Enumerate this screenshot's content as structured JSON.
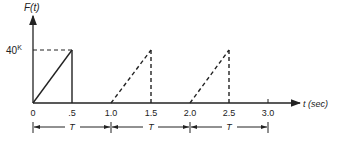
{
  "diagram": {
    "y_axis_label": "F(t)",
    "x_axis_label": "t (sec)",
    "level_label": "40",
    "level_superscript": "K",
    "x_ticks": [
      "0",
      ".5",
      "1.0",
      "1.5",
      "2.0",
      "2.5",
      "3.0"
    ],
    "period_label": "T",
    "periods": [
      {
        "from": "0",
        "to": "1.0",
        "label": "T"
      },
      {
        "from": "1.0",
        "to": "2.0",
        "label": "T"
      },
      {
        "from": "2.0",
        "to": "3.0",
        "label": "T"
      }
    ],
    "pulses": [
      {
        "start": 0.0,
        "peak_time": 0.5,
        "peak": 40,
        "style": "solid"
      },
      {
        "start": 1.0,
        "peak_time": 1.5,
        "peak": 40,
        "style": "dashed"
      },
      {
        "start": 2.0,
        "peak_time": 2.5,
        "peak": 40,
        "style": "dashed"
      }
    ],
    "line_color": "#222222"
  }
}
